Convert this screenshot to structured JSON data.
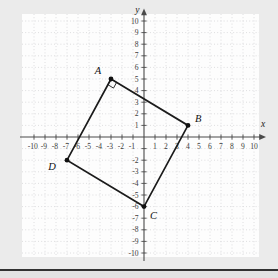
{
  "chart_data": {
    "type": "scatter",
    "title": "",
    "xlabel": "x",
    "ylabel": "y",
    "xlim": [
      -10,
      10
    ],
    "ylim": [
      -10,
      10
    ],
    "grid": true,
    "x_tick_labels": [
      -10,
      -9,
      -8,
      -7,
      -6,
      -5,
      -4,
      -3,
      -2,
      -1,
      1,
      2,
      3,
      4,
      5,
      6,
      7,
      8,
      9,
      10
    ],
    "y_tick_labels": [
      10,
      9,
      8,
      7,
      6,
      5,
      4,
      3,
      2,
      1,
      -2,
      -3,
      -4,
      -5,
      -6,
      -7,
      -8,
      -9,
      -10
    ],
    "points": [
      {
        "label": "A",
        "x": -3,
        "y": 5,
        "label_pos": "above-left"
      },
      {
        "label": "B",
        "x": 4,
        "y": 1,
        "label_pos": "above-right"
      },
      {
        "label": "C",
        "x": 0,
        "y": -6,
        "label_pos": "below-right"
      },
      {
        "label": "D",
        "x": -7,
        "y": -2,
        "label_pos": "below-left"
      }
    ],
    "polygon": [
      "A",
      "B",
      "C",
      "D"
    ],
    "right_angle_marker": {
      "at": "A",
      "between": [
        "B",
        "D"
      ]
    }
  },
  "colors": {
    "page_bg": "#ebebeb",
    "panel_bg": "#fdfdfd",
    "grid": "#d5d5d8",
    "axis": "#4a4a4a",
    "tick_text": "#3c3c3c",
    "shape": "#1b1b1b",
    "point": "#111111",
    "axis_label_text": "#222222",
    "divider": "#323232",
    "footer_bg": "#e3e3e3"
  }
}
